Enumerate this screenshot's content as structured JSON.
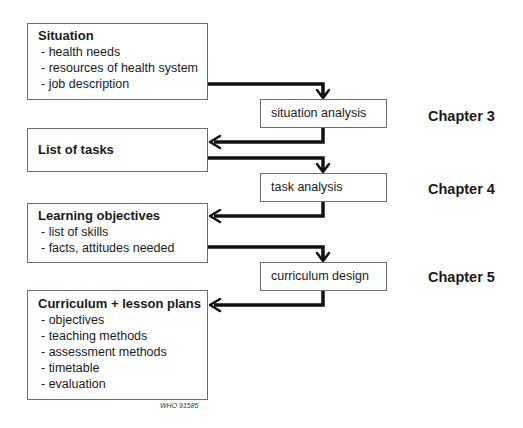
{
  "left_boxes": [
    {
      "title": "Situation",
      "items": [
        "- health needs",
        "- resources of health system",
        "- job description"
      ]
    },
    {
      "title": "List of tasks",
      "items": []
    },
    {
      "title": "Learning objectives",
      "items": [
        "- list of skills",
        "- facts, attitudes needed"
      ]
    },
    {
      "title": "Curriculum + lesson plans",
      "items": [
        "- objectives",
        "- teaching methods",
        "- assessment methods",
        "- timetable",
        "- evaluation"
      ]
    }
  ],
  "process_boxes": [
    {
      "label": "situation analysis"
    },
    {
      "label": "task analysis"
    },
    {
      "label": "curriculum design"
    }
  ],
  "chapters": [
    {
      "label": "Chapter 3"
    },
    {
      "label": "Chapter 4"
    },
    {
      "label": "Chapter 5"
    }
  ],
  "figure_code": "WHO 91585"
}
